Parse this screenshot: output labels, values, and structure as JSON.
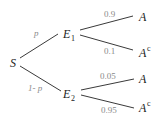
{
  "diagram": {
    "type": "probability-tree",
    "root": {
      "label": "S"
    },
    "level1": [
      {
        "label": "E",
        "subscript": "1",
        "edge_label": "p"
      },
      {
        "label": "E",
        "subscript": "2",
        "edge_label": "1- p"
      }
    ],
    "level2": [
      {
        "parent": "E1",
        "label": "A",
        "superscript": "",
        "edge_label": "0.9"
      },
      {
        "parent": "E1",
        "label": "A",
        "superscript": "c",
        "edge_label": "0.1"
      },
      {
        "parent": "E2",
        "label": "A",
        "superscript": "",
        "edge_label": "0.05"
      },
      {
        "parent": "E2",
        "label": "A",
        "superscript": "c",
        "edge_label": "0.95"
      }
    ],
    "colors": {
      "edge": "#3a3a3a",
      "node_text": "#222222",
      "edge_label_text": "#8a8a8a"
    }
  }
}
